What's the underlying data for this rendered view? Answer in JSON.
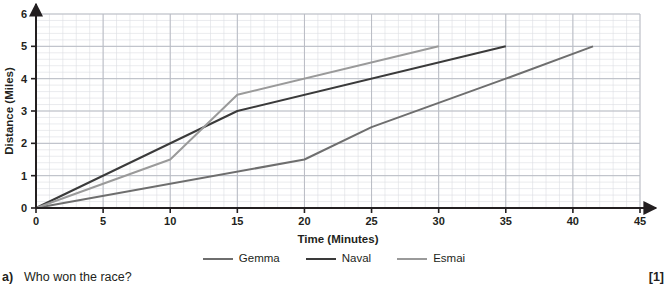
{
  "chart_data": {
    "type": "line",
    "title": "",
    "xlabel": "Time (Minutes)",
    "ylabel": "Distance (Miles)",
    "xlim": [
      0,
      45
    ],
    "ylim": [
      0,
      6
    ],
    "xticks": [
      0,
      5,
      10,
      15,
      20,
      25,
      30,
      35,
      40,
      45
    ],
    "yticks": [
      0,
      1,
      2,
      3,
      4,
      5,
      6
    ],
    "xtick_labels": [
      "0",
      "5",
      "10",
      "15",
      "20",
      "25",
      "30",
      "35",
      "40",
      "45"
    ],
    "ytick_labels": [
      "0",
      "1",
      "2",
      "3",
      "4",
      "5",
      "6"
    ],
    "grid": true,
    "grid_major_step_x": 5,
    "grid_major_step_y": 1,
    "grid_minor_step_x": 1,
    "grid_minor_step_y": 0.2,
    "legend_position": "below",
    "series": [
      {
        "name": "Gemma",
        "color": "#6e6e6e",
        "x": [
          0,
          20,
          25,
          35,
          41.5
        ],
        "y": [
          0,
          1.5,
          2.5,
          4,
          5
        ]
      },
      {
        "name": "Naval",
        "color": "#3a3a3a",
        "x": [
          0,
          15,
          35
        ],
        "y": [
          0,
          3,
          5
        ]
      },
      {
        "name": "Esmai",
        "color": "#9a9a9a",
        "x": [
          0,
          10,
          15,
          30
        ],
        "y": [
          0,
          1.5,
          3.5,
          5
        ]
      }
    ]
  },
  "legend": {
    "entries": [
      {
        "label": "Gemma",
        "color": "#6e6e6e"
      },
      {
        "label": "Naval",
        "color": "#3a3a3a"
      },
      {
        "label": "Esmai",
        "color": "#9a9a9a"
      }
    ]
  },
  "question": {
    "letter": "a)",
    "text": "Who won the race?",
    "marks": "[1]"
  },
  "colors": {
    "axis": "#231f20",
    "grid_major": "#b9bcc4",
    "grid_minor": "#dcdee3",
    "plot_background": "#ffffff",
    "text": "#231f20"
  }
}
